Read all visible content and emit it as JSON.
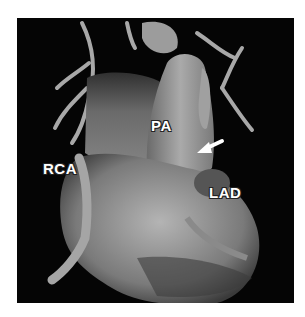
{
  "figure": {
    "labels": {
      "rca": "RCA",
      "pa": "PA",
      "lad": "LAD"
    },
    "arrow": {
      "direction": "down-left",
      "color": "#ffffff"
    },
    "colors": {
      "background": "#ffffff",
      "panel": "#050505",
      "tissue": "#9a9a9a"
    }
  }
}
